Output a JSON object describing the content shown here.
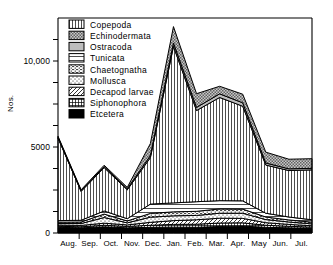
{
  "chart_data": {
    "type": "area",
    "stacked": true,
    "title": "",
    "xlabel": "",
    "ylabel": "Nos.",
    "ylim": [
      0,
      12500
    ],
    "grid": false,
    "legend_position": "top-left-inside",
    "categories": [
      "Aug.",
      "Sep.",
      "Oct.",
      "Nov.",
      "Dec.",
      "Jan.",
      "Feb.",
      "Mar.",
      "Apr.",
      "May",
      "Jun.",
      "Jul."
    ],
    "yticks": [
      0,
      1250,
      2500,
      3750,
      5000,
      6250,
      7500,
      8750,
      10000,
      11250
    ],
    "ytick_labels": {
      "0": "0",
      "5000": "5000",
      "10000": "10,000"
    },
    "series": [
      {
        "name": "Etcetera",
        "pattern": "solid-black",
        "values": [
          330,
          300,
          360,
          300,
          330,
          340,
          330,
          380,
          400,
          330,
          300,
          270
        ]
      },
      {
        "name": "Siphonophora",
        "pattern": "grid-hatch",
        "values": [
          60,
          60,
          90,
          80,
          120,
          160,
          180,
          200,
          190,
          120,
          90,
          70
        ]
      },
      {
        "name": "Decapod larvae",
        "pattern": "diagonal-hatch",
        "values": [
          70,
          80,
          120,
          90,
          170,
          220,
          260,
          280,
          260,
          150,
          110,
          80
        ]
      },
      {
        "name": "Mollusca",
        "pattern": "sparse-dots",
        "values": [
          90,
          110,
          330,
          120,
          300,
          280,
          250,
          290,
          300,
          180,
          140,
          110
        ]
      },
      {
        "name": "Chaetognatha",
        "pattern": "horizontal-dash",
        "values": [
          80,
          90,
          200,
          110,
          220,
          230,
          240,
          250,
          240,
          150,
          120,
          100
        ]
      },
      {
        "name": "Tunicata",
        "pattern": "horizontal-lines",
        "values": [
          90,
          100,
          180,
          130,
          540,
          520,
          560,
          480,
          480,
          220,
          170,
          140
        ]
      },
      {
        "name": "Copepoda",
        "pattern": "vertical-lines",
        "values": [
          4800,
          1680,
          2520,
          1680,
          2700,
          9100,
          5300,
          6000,
          5500,
          2800,
          2700,
          2900
        ]
      },
      {
        "name": "Ostracoda",
        "pattern": "light-gray-fill",
        "values": [
          50,
          40,
          60,
          60,
          120,
          200,
          180,
          210,
          200,
          120,
          100,
          90
        ]
      },
      {
        "name": "Echinodermata",
        "pattern": "checker-gray",
        "values": [
          60,
          50,
          80,
          80,
          700,
          950,
          800,
          440,
          500,
          630,
          560,
          560
        ]
      }
    ],
    "totals": [
      5630,
      2510,
      3940,
      2650,
      5200,
      12000,
      8100,
      8530,
      8070,
      4700,
      4290,
      4320
    ],
    "peak_month": "Jan.",
    "peak_value": 12000
  },
  "legend": {
    "items": [
      {
        "label": "Copepoda",
        "swatch": "vertical-lines"
      },
      {
        "label": "Echinodermata",
        "swatch": "checker-gray"
      },
      {
        "label": "Ostracoda",
        "swatch": "light-gray-fill"
      },
      {
        "label": "Tunicata",
        "swatch": "horizontal-lines"
      },
      {
        "label": "Chaetognatha",
        "swatch": "horizontal-dash"
      },
      {
        "label": "Mollusca",
        "swatch": "sparse-dots"
      },
      {
        "label": "Decapod larvae",
        "swatch": "diagonal-hatch"
      },
      {
        "label": "Siphonophora",
        "swatch": "grid-hatch"
      },
      {
        "label": "Etcetera",
        "swatch": "solid-black"
      }
    ]
  },
  "axes": {
    "y_title": "Nos.",
    "y_labels": [
      "10,000",
      "5000",
      "0"
    ],
    "x_labels": [
      "Aug.",
      "Sep.",
      "Oct.",
      "Nov.",
      "Dec.",
      "Jan.",
      "Feb.",
      "Mar.",
      "Apr.",
      "May",
      "Jun.",
      "Jul."
    ]
  },
  "colors": {
    "ink": "#000000",
    "background": "#ffffff",
    "light_gray": "#d9d9d9",
    "mid_gray": "#b3b3b3"
  }
}
